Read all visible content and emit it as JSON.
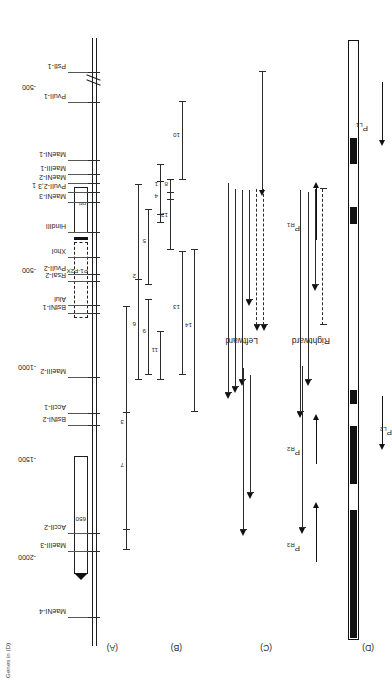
{
  "figure": {
    "caption_fragment": "Genes in (D)",
    "panels": [
      {
        "id": "A",
        "label": "(A)"
      },
      {
        "id": "B",
        "label": "(B)"
      },
      {
        "id": "C",
        "label": "(C)"
      },
      {
        "id": "D",
        "label": "(D)"
      }
    ],
    "direction_labels": [
      {
        "name": "leftward",
        "text": "Leftward"
      },
      {
        "name": "rightward",
        "text": "Rightward"
      }
    ]
  },
  "scale": {
    "name": "coordinate-scale",
    "ticks": [
      {
        "label": "-2000",
        "pos": 115
      },
      {
        "label": "-1500",
        "pos": 213
      },
      {
        "label": "-1000",
        "pos": 305
      },
      {
        "label": "-500",
        "pos": 402
      },
      {
        "label": "1",
        "pos": 487
      },
      {
        "label": "-500",
        "pos": 585
      }
    ]
  },
  "panelA": {
    "name": "restriction-map",
    "box_650": "650",
    "box_ori": "ori",
    "box_pipox": "P1-P2X",
    "sites": [
      {
        "label": "MaeNI-4",
        "pos": 62
      },
      {
        "label": "MaeIII-3",
        "pos": 128
      },
      {
        "label": "AccII-2",
        "pos": 146
      },
      {
        "label": "BstNI-2",
        "pos": 254
      },
      {
        "label": "AccII-1",
        "pos": 266
      },
      {
        "label": "MaeIII-2",
        "pos": 302
      },
      {
        "label": "BstNI-1",
        "pos": 366
      },
      {
        "label": "AluI",
        "pos": 374
      },
      {
        "label": "RsaI-2",
        "pos": 398
      },
      {
        "label": "PvuII-2",
        "pos": 405
      },
      {
        "label": "XhoI",
        "pos": 422
      },
      {
        "label": "HindIII",
        "pos": 447
      },
      {
        "label": "MaeNI-3",
        "pos": 477
      },
      {
        "label": "PvuII-2,3",
        "pos": 487
      },
      {
        "label": "MaeNI-2",
        "pos": 496
      },
      {
        "label": "MaeIII-1",
        "pos": 505
      },
      {
        "label": "MaeNI-1",
        "pos": 519
      },
      {
        "label": "PvuII-1",
        "pos": 577
      },
      {
        "label": "PstI-1",
        "pos": 607
      }
    ]
  },
  "panelB": {
    "name": "fragment-set",
    "fragments": [
      {
        "id": "1",
        "start": 465,
        "end": 515
      },
      {
        "id": "2",
        "start": 300,
        "end": 495
      },
      {
        "id": "3",
        "start": 130,
        "end": 373
      },
      {
        "id": "4",
        "start": 457,
        "end": 498
      },
      {
        "id": "5",
        "start": 395,
        "end": 470
      },
      {
        "id": "6",
        "start": 300,
        "end": 400
      },
      {
        "id": "7",
        "start": 150,
        "end": 267
      },
      {
        "id": "8",
        "start": 480,
        "end": 500
      },
      {
        "id": "9",
        "start": 305,
        "end": 380
      },
      {
        "id": "10",
        "start": 500,
        "end": 578
      },
      {
        "id": "11",
        "start": 300,
        "end": 348
      },
      {
        "id": "12",
        "start": 430,
        "end": 487
      },
      {
        "id": "13",
        "start": 305,
        "end": 428
      },
      {
        "id": "14",
        "start": 268,
        "end": 430
      }
    ]
  },
  "panelC": {
    "name": "transcript-map",
    "leftward_transcripts": 7,
    "rightward_transcripts": 5
  },
  "panelD": {
    "name": "promoter-map",
    "promoters": [
      {
        "label": "PR3",
        "sub": "R3",
        "direction": "right"
      },
      {
        "label": "PR2",
        "sub": "R2",
        "direction": "right"
      },
      {
        "label": "PL2",
        "sub": "L2",
        "direction": "left"
      },
      {
        "label": "PR1",
        "sub": "R1",
        "direction": "right"
      },
      {
        "label": "PL1",
        "sub": "L1",
        "direction": "left"
      }
    ]
  }
}
